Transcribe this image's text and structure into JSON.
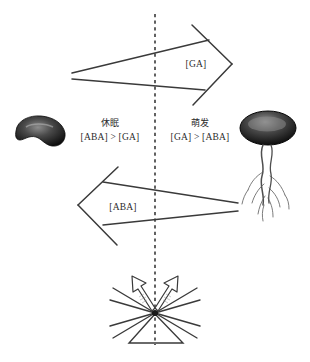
{
  "figure": {
    "background_color": "#ffffff",
    "stroke_color": "#3a3a3a",
    "text_color": "#2b2b2b",
    "divider": {
      "name": "dashed-center-divider",
      "style": "dashed-vertical",
      "x": 155,
      "y_top": 14,
      "y_bottom": 345
    }
  },
  "arrows": {
    "ga": {
      "label": "[GA]",
      "direction": "right",
      "label_x": 196,
      "label_y": 64
    },
    "aba": {
      "label": "[ABA]",
      "direction": "left",
      "label_x": 123,
      "label_y": 207
    }
  },
  "states": {
    "dormancy": {
      "title": "休眠",
      "ratio": "[ABA] > [GA]",
      "x": 110,
      "y": 124
    },
    "germination": {
      "title": "萌发",
      "ratio": "[GA] > [ABA]",
      "x": 199,
      "y": 124
    }
  },
  "seeds": {
    "dormant": {
      "name": "dormant-seed",
      "shape": "kidney-bean-dark",
      "cx": 40,
      "cy": 133
    },
    "germinating": {
      "name": "germinating-seed",
      "shape": "seed-with-radicle",
      "cx": 268,
      "cy": 130
    }
  },
  "burst": {
    "name": "signal-convergence-burst",
    "center_x": 155,
    "center_y": 313,
    "ray_count": 6,
    "triangle": true,
    "outline_arrows": 2
  }
}
